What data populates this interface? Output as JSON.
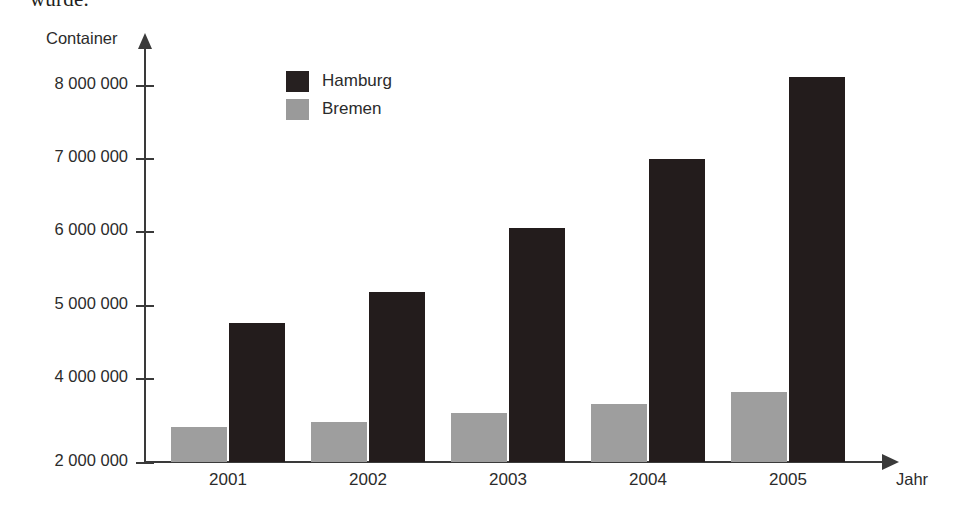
{
  "page": {
    "cut_off_text": "wurde."
  },
  "chart_data": {
    "type": "bar",
    "title": "",
    "xlabel": "Jahr",
    "ylabel": "Container",
    "categories": [
      "2001",
      "2002",
      "2003",
      "2004",
      "2005"
    ],
    "series": [
      {
        "name": "Hamburg",
        "color": "#231c1c",
        "values": [
          4800000,
          5200000,
          6100000,
          7000000,
          8100000
        ]
      },
      {
        "name": "Bremen",
        "color": "#9e9e9e",
        "values": [
          2450000,
          2500000,
          2600000,
          2700000,
          2850000
        ]
      }
    ],
    "ylim": [
      2000000,
      8500000
    ],
    "ytick_labels": [
      "8 000 000",
      "7 000 000",
      "6 000 000",
      "5 000 000",
      "4 000 000",
      "2 000 000"
    ],
    "ytick_values": [
      8000000,
      7000000,
      6000000,
      5000000,
      4000000,
      2000000
    ],
    "grid": false,
    "legend_position": "top-center",
    "legend": [
      {
        "label": "Hamburg",
        "color": "#262020"
      },
      {
        "label": "Bremen",
        "color": "#9a9a9a"
      }
    ]
  },
  "layout": {
    "ytick_y": [
      85,
      158,
      231,
      305,
      378,
      462
    ],
    "group_centers": [
      228,
      368,
      508,
      648,
      788
    ],
    "bar_width": 56,
    "bar_gap": 2,
    "baseline_y": 462,
    "bar_tops": {
      "bremen": [
        427,
        422,
        413,
        404,
        392
      ],
      "hamburg": [
        323,
        292,
        228,
        159,
        77
      ]
    }
  }
}
